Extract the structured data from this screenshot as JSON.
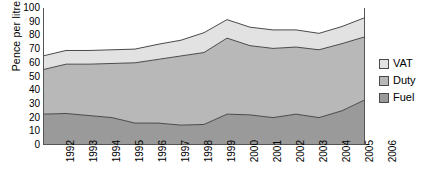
{
  "chart_data": {
    "type": "area",
    "stacked": true,
    "title": "",
    "subtitle": "",
    "xlabel": "",
    "ylabel": "Pence per litre",
    "categories": [
      "1992",
      "1993",
      "1994",
      "1995",
      "1996",
      "1997",
      "1998",
      "1999",
      "2000",
      "2001",
      "2002",
      "2003",
      "2004",
      "2005",
      "2006"
    ],
    "series": [
      {
        "name": "Fuel",
        "color": "#9a9a9a",
        "values": [
          22.5,
          23,
          21.5,
          20,
          16,
          16,
          14.5,
          15,
          22.5,
          22,
          20,
          22.5,
          20,
          25,
          33
        ]
      },
      {
        "name": "Duty",
        "color": "#b8b8b8",
        "values": [
          32.5,
          36,
          37.5,
          39.5,
          44,
          46.5,
          50.5,
          52.5,
          55.5,
          50.5,
          50.5,
          49,
          49.5,
          49,
          46
        ]
      },
      {
        "name": "VAT",
        "color": "#e2e2e2",
        "values": [
          10,
          10,
          10,
          10,
          10,
          11,
          11.5,
          14.5,
          13.5,
          13.5,
          13.5,
          12.5,
          12,
          12.5,
          14
        ]
      }
    ],
    "cumulative_tops": {
      "fuel": [
        22.5,
        23,
        21.5,
        20,
        16,
        16,
        14.5,
        15,
        22.5,
        22,
        20,
        22.5,
        20,
        25,
        33
      ],
      "fuel_duty": [
        55,
        59,
        59,
        59.5,
        60,
        62.5,
        65,
        67.5,
        78,
        72.5,
        70.5,
        71.5,
        69.5,
        74,
        79
      ],
      "total": [
        65,
        69,
        69,
        69.5,
        70,
        73.5,
        76.5,
        82,
        91.5,
        86,
        84,
        84,
        81.5,
        86.5,
        93
      ]
    },
    "ylim": [
      0,
      100
    ],
    "y_ticks": [
      0,
      10,
      20,
      30,
      40,
      50,
      60,
      70,
      80,
      90,
      100
    ],
    "grid": false,
    "legend": {
      "position": "right",
      "entries": [
        {
          "label": "VAT",
          "color": "#e2e2e2"
        },
        {
          "label": "Duty",
          "color": "#b8b8b8"
        },
        {
          "label": "Fuel",
          "color": "#9a9a9a"
        }
      ]
    },
    "axis_color": "#555555",
    "line_color": "#4a4a4a"
  },
  "caption": ""
}
